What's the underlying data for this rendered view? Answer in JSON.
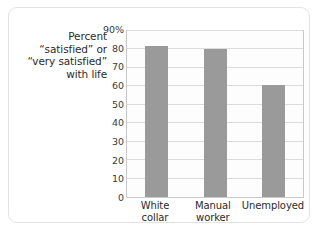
{
  "chart_data": {
    "type": "bar",
    "title": "",
    "subtitle": "",
    "xlabel": "",
    "ylabel": "Percent “satisfied” or “very satisfied” with life",
    "ylabel_lines": [
      "Percent",
      "“satisfied” or",
      "“very satisfied”",
      "with life"
    ],
    "categories": [
      "White collar",
      "Manual worker",
      "Unemployed"
    ],
    "category_lines": [
      [
        "White collar"
      ],
      [
        "Manual",
        "worker"
      ],
      [
        "Unemployed"
      ]
    ],
    "values": [
      82,
      80.5,
      61
    ],
    "ylim": [
      0,
      90
    ],
    "ytick_values": [
      90,
      80,
      70,
      60,
      50,
      40,
      30,
      20,
      10,
      0
    ],
    "ytick_labels": [
      "90%",
      "80",
      "70",
      "60",
      "50",
      "40",
      "30",
      "20",
      "10",
      "0"
    ],
    "grid": "horizontal",
    "legend": "none",
    "bar_color": "#9a9a9a",
    "plot_border_color": "#c9c9c9",
    "gridline_color": "#dcdcdc",
    "card_border_color": "#e3e3e3",
    "background_color": "#ffffff"
  }
}
